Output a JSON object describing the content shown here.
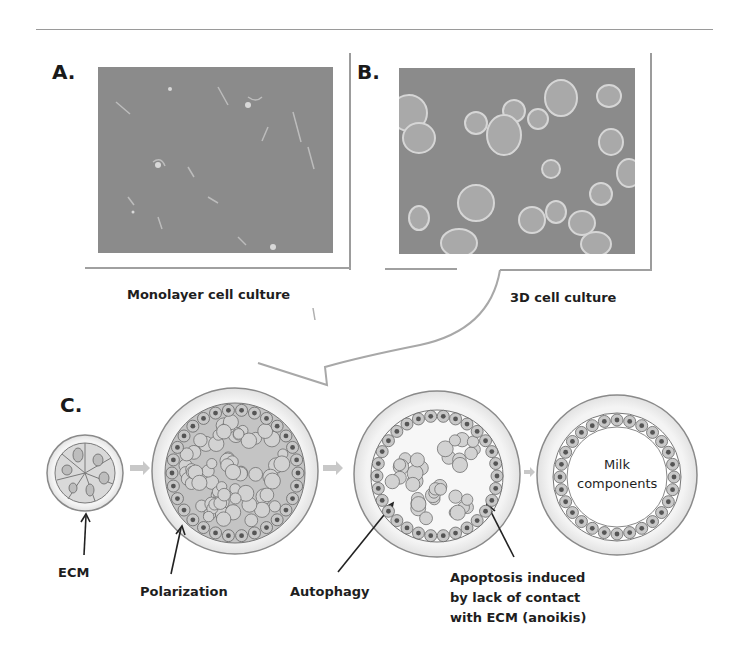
{
  "figure": {
    "panels": [
      {
        "id": "A",
        "label": "A.",
        "caption": "Monolayer cell culture",
        "image": "monolayer-micrograph"
      },
      {
        "id": "B",
        "label": "B.",
        "caption": "3D cell culture",
        "image": "spheroid-micrograph"
      }
    ],
    "panel_c": {
      "label": "C.",
      "stages": [
        {
          "name": "small-acinus",
          "annotation": "ECM"
        },
        {
          "name": "filled-sphere",
          "annotation": "Polarization"
        },
        {
          "name": "lumen-forming-sphere",
          "annotations": [
            "Autophagy",
            "Apoptosis induced by lack of contact with ECM (anoikis)"
          ]
        },
        {
          "name": "hollow-acinus",
          "inner_text": [
            "Milk",
            "components"
          ]
        }
      ],
      "apoptosis_lines": [
        "Apoptosis induced",
        "by lack of contact",
        "with ECM (anoikis)"
      ]
    },
    "colors": {
      "photo_bg": "#8b8b8b",
      "frame_line": "#9c9c9c",
      "sphere_outer": "#ededed",
      "cell_fill": "#b8b8b8",
      "nucleus": "#555555",
      "arrow_fill": "#c8c8c8",
      "text": "#1e1e1e"
    }
  }
}
